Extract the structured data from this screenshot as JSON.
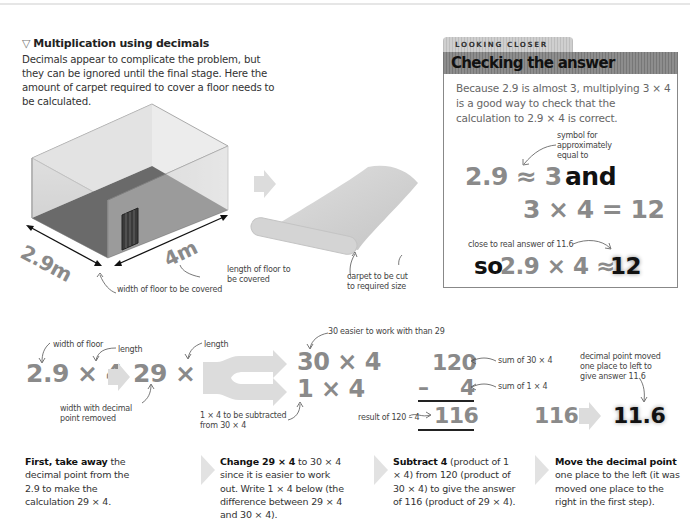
{
  "intro": {
    "title_icon": "▽",
    "title": "Multiplication using decimals",
    "body": "Decimals appear to complicate the problem, but they can be ignored until the final stage. Here the amount of carpet required to cover a floor needs to be calculated."
  },
  "room": {
    "width_label": "2.9m",
    "length_label": "4m",
    "width_annotation": "width of floor to be covered",
    "length_annotation_1": "length of floor to",
    "length_annotation_2": "be covered",
    "carpet_annotation_1": "carpet to be cut",
    "carpet_annotation_2": "to required size"
  },
  "looking_closer": {
    "tab": "LOOKING CLOSER",
    "heading": "Checking the answer",
    "body": "Because 2.9 is almost 3, multiplying 3 × 4 is a good way to check that the calculation to 2.9 × 4 is correct.",
    "symbol_note_1": "symbol for",
    "symbol_note_2": "approximately",
    "symbol_note_3": "equal to",
    "line1_expr": "2.9 ≈ 3",
    "line1_word": "and",
    "line2_expr": "3 × 4 = 12",
    "close_note": "close to real answer of 11.6",
    "line3_so": "so",
    "line3_expr": "2.9 × 4 ≈",
    "line3_result": "12"
  },
  "workflow": {
    "eq1": "2.9 × 4",
    "eq1_note_width": "width of floor",
    "eq1_note_length": "length",
    "eq2": "29 × 4",
    "eq2_note_length": "length",
    "eq2_note_removed_1": "width with decimal",
    "eq2_note_removed_2": "point removed",
    "eq3a": "30 × 4",
    "eq3b": "1 × 4",
    "eq3_note_top": "30 easier to work with than 29",
    "eq3_note_sub_1": "1 × 4 to be subtracted",
    "eq3_note_sub_2": "from 30 × 4",
    "sub_top": "120",
    "sub_minus": "–",
    "sub_mid": "4",
    "sub_result": "116",
    "sub_note_top": "sum of 30 × 4",
    "sub_note_mid": "sum of 1 × 4",
    "sub_note_result": "result of 120 – 4",
    "final_from": "116",
    "final_to": "11.6",
    "final_note_1": "decimal point moved",
    "final_note_2": "one place to left to",
    "final_note_3": "give answer 11.6"
  },
  "steps": [
    {
      "bold": "First, take away",
      "text": " the decimal point from the 2.9 to make the calculation 29 × 4."
    },
    {
      "bold": "Change 29 × 4",
      "text": " to 30 × 4 since it is easier to work out. Write 1 × 4 below (the difference between 29 × 4 and 30 × 4)."
    },
    {
      "bold": "Subtract 4",
      "text": " (product of 1 × 4) from 120 (product of 30 × 4) to give the answer of 116 (product of 29 × 4)."
    },
    {
      "bold": "Move the decimal point",
      "text": " one place to the left (it was moved one place to the right in the first step)."
    }
  ],
  "colors": {
    "number_grey": "#8a8a8a",
    "header_grey": "#808080",
    "answer_black": "#111111"
  }
}
